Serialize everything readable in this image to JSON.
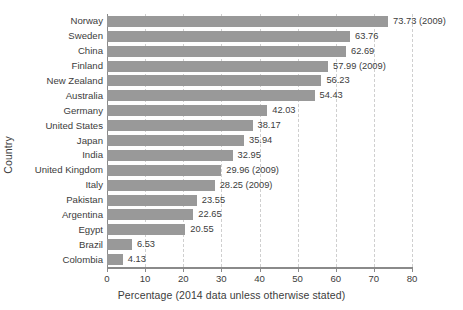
{
  "chart_data": {
    "type": "bar",
    "orientation": "horizontal",
    "title": "",
    "xlabel": "Percentage (2014 data unless otherwise stated)",
    "ylabel": "Country",
    "xlim": [
      0,
      80
    ],
    "xticks": [
      0,
      10,
      20,
      30,
      40,
      50,
      60,
      70,
      80
    ],
    "grid": "vertical-dashed",
    "legend": "none",
    "bar_color": "#999999",
    "categories": [
      "Norway",
      "Sweden",
      "China",
      "Finland",
      "New Zealand",
      "Australia",
      "Germany",
      "United States",
      "Japan",
      "India",
      "United Kingdom",
      "Italy",
      "Pakistan",
      "Argentina",
      "Egypt",
      "Brazil",
      "Colombia"
    ],
    "values": [
      73.73,
      63.76,
      62.69,
      57.99,
      56.23,
      54.43,
      42.03,
      38.17,
      35.94,
      32.95,
      29.96,
      28.25,
      23.55,
      22.65,
      20.55,
      6.53,
      4.13
    ],
    "data_labels": [
      "73.73 (2009)",
      "63.76",
      "62.69",
      "57.99 (2009)",
      "56.23",
      "54.43",
      "42.03",
      "38.17",
      "35.94",
      "32.95",
      "29.96 (2009)",
      "28.25 (2009)",
      "23.55",
      "22.65",
      "20.55",
      "6.53",
      "4.13"
    ],
    "annotations": [
      "Values followed by (2009) are from 2009 rather than 2014"
    ]
  }
}
